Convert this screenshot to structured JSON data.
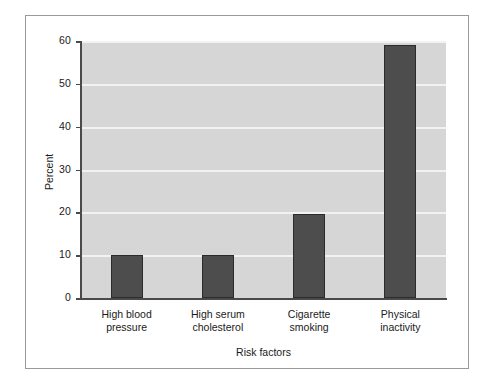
{
  "chart_data": {
    "type": "bar",
    "title": "",
    "xlabel": "Risk factors",
    "ylabel": "Percent",
    "categories": [
      "High blood pressure",
      "High serum cholesterol",
      "Cigarette smoking",
      "Physical inactivity"
    ],
    "category_lines": [
      [
        "High blood",
        "pressure"
      ],
      [
        "High serum",
        "cholesterol"
      ],
      [
        "Cigarette",
        "smoking"
      ],
      [
        "Physical",
        "inactivity"
      ]
    ],
    "values": [
      10,
      10,
      19.5,
      59
    ],
    "ylim": [
      0,
      60
    ],
    "yticks": [
      0,
      10,
      20,
      30,
      40,
      50,
      60
    ],
    "ytick_labels": [
      "0",
      "10",
      "20",
      "30",
      "40",
      "50",
      "60"
    ],
    "grid": true,
    "grid_axis": "y",
    "legend": false,
    "legend_position": "none",
    "bar_color": "#4d4d4d",
    "bar_edge_color": "#2b2b2b",
    "plot_background": "#d6d6d6",
    "gridline_color": "#f2f2f2",
    "axis_color": "#4a4a4a",
    "frame_color": "#9a9a9a",
    "page_background": "#ffffff"
  }
}
